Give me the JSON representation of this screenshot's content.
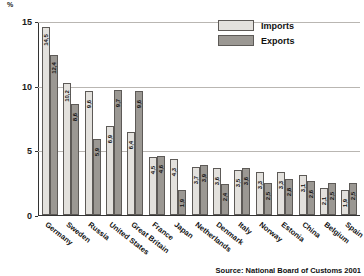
{
  "chart_data": {
    "type": "bar",
    "title": "",
    "xlabel": "",
    "ylabel": "%",
    "ylim": [
      0,
      15
    ],
    "yticks": [
      "0",
      "5",
      "10",
      "15"
    ],
    "grid": true,
    "legend_position": "top-right",
    "categories": [
      "Germany",
      "Sweden",
      "Russia",
      "United States",
      "Great Britain",
      "France",
      "Japan",
      "Netherlands",
      "Denmark",
      "Italy",
      "Norway",
      "Estonia",
      "China",
      "Belgium",
      "Spain"
    ],
    "series": [
      {
        "name": "Imports",
        "color": "#e3e1dd",
        "values": [
          14.5,
          10.2,
          9.6,
          6.9,
          6.4,
          4.5,
          4.3,
          3.7,
          3.6,
          3.5,
          3.3,
          3.3,
          3.1,
          2.1,
          1.9
        ]
      },
      {
        "name": "Exports",
        "color": "#9b9893",
        "values": [
          12.4,
          8.6,
          5.9,
          9.7,
          9.6,
          4.6,
          1.9,
          3.9,
          2.4,
          3.6,
          2.5,
          2.8,
          2.6,
          2.5,
          2.5
        ]
      }
    ],
    "source_note": "Source: National Board of Customs 2001"
  }
}
